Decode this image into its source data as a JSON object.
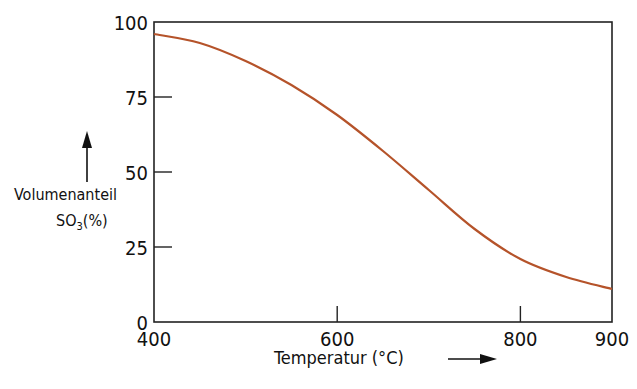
{
  "chart_data": {
    "type": "line",
    "title": "",
    "xlabel": "Temperatur (°C)",
    "ylabel_line1": "Volumenanteil",
    "ylabel_line2": "SO",
    "ylabel_sub": "3",
    "ylabel_unit": "(%)",
    "xlim": [
      400,
      900
    ],
    "ylim": [
      0,
      100
    ],
    "x_ticks": [
      400,
      600,
      800,
      900
    ],
    "y_ticks": [
      0,
      25,
      50,
      75,
      100
    ],
    "grid": false,
    "legend": null,
    "series": [
      {
        "name": "SO3 Volumenanteil",
        "color": "#b5532a",
        "x": [
          400,
          450,
          500,
          550,
          600,
          650,
          700,
          750,
          800,
          850,
          900
        ],
        "values": [
          96,
          93,
          87,
          79,
          69,
          57,
          44,
          31,
          21,
          15,
          11
        ]
      }
    ]
  }
}
